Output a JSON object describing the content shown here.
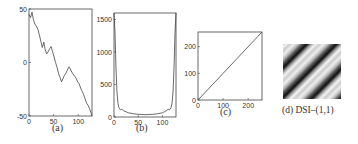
{
  "chart_data": [
    {
      "type": "line",
      "caption": "(a)",
      "xlabel": "",
      "ylabel": "",
      "xlim": [
        0,
        128
      ],
      "ylim": [
        -50,
        50
      ],
      "xticks": [
        "0",
        "50",
        "100"
      ],
      "yticks": [
        "-50",
        "0",
        "50"
      ],
      "grid": false,
      "series": [
        {
          "name": "signal",
          "x": [
            0,
            3,
            6,
            9,
            12,
            15,
            18,
            21,
            24,
            27,
            30,
            33,
            36,
            39,
            42,
            45,
            48,
            51,
            54,
            57,
            60,
            63,
            66,
            69,
            72,
            75,
            78,
            81,
            84,
            87,
            90,
            93,
            96,
            99,
            102,
            105,
            108,
            111,
            114,
            117,
            120,
            123,
            126,
            128
          ],
          "values": [
            45,
            42,
            47,
            40,
            36,
            34,
            31,
            26,
            20,
            14,
            19,
            12,
            8,
            10,
            13,
            15,
            10,
            5,
            0,
            -5,
            -10,
            -14,
            -18,
            -15,
            -12,
            -10,
            -7,
            -4,
            -6,
            -9,
            -11,
            -13,
            -15,
            -18,
            -20,
            -24,
            -27,
            -30,
            -34,
            -38,
            -40,
            -43,
            -47,
            -50
          ]
        }
      ]
    },
    {
      "type": "line",
      "caption": "(b)",
      "xlabel": "",
      "ylabel": "",
      "xlim": [
        0,
        128
      ],
      "ylim": [
        0,
        1600
      ],
      "xticks": [
        "0",
        "50",
        "100"
      ],
      "yticks": [
        "0",
        "500",
        "1000",
        "1500"
      ],
      "grid": false,
      "series": [
        {
          "name": "spectrum",
          "x": [
            0,
            2,
            4,
            6,
            8,
            10,
            12,
            14,
            16,
            20,
            25,
            30,
            40,
            50,
            60,
            64,
            70,
            80,
            90,
            100,
            104,
            108,
            112,
            114,
            116,
            118,
            120,
            122,
            124,
            126,
            128
          ],
          "values": [
            1600,
            1300,
            800,
            400,
            220,
            150,
            120,
            110,
            120,
            95,
            80,
            65,
            50,
            42,
            38,
            36,
            38,
            42,
            50,
            65,
            80,
            95,
            120,
            110,
            120,
            150,
            220,
            400,
            800,
            1300,
            1600
          ]
        }
      ]
    },
    {
      "type": "line",
      "caption": "(c)",
      "xlabel": "",
      "ylabel": "",
      "xlim": [
        0,
        255
      ],
      "ylim": [
        0,
        255
      ],
      "xticks": [
        "0",
        "100",
        "200"
      ],
      "yticks": [
        "0",
        "100",
        "200"
      ],
      "grid": false,
      "series": [
        {
          "name": "identity",
          "x": [
            0,
            255
          ],
          "values": [
            0,
            255
          ]
        }
      ]
    },
    {
      "type": "heatmap",
      "caption": "(d)  DSI–(1,1)",
      "description": "diagonal stripe pattern, grayscale, stripes from lower-left to upper-right"
    }
  ]
}
